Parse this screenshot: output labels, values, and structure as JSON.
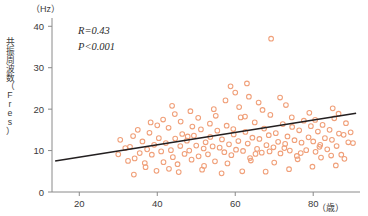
{
  "chart_data": {
    "type": "scatter",
    "title": "",
    "xlabel": "（歳）",
    "ylabel": "共振周波数（Fres）",
    "yunit": "（Hz）",
    "xlim": [
      13,
      92
    ],
    "ylim": [
      0,
      42
    ],
    "xticks": [
      20,
      40,
      60,
      80
    ],
    "xtick_labels": [
      "20",
      "40",
      "60",
      "80"
    ],
    "yticks": [
      0,
      10,
      20,
      30,
      40
    ],
    "ytick_labels": [
      "0",
      "10",
      "20",
      "30",
      "40"
    ],
    "grid": false,
    "legend": "none",
    "marker_style": "open-circle",
    "marker_color": "#f0a07a",
    "annotations": [
      {
        "name": "correlation",
        "text": "R=0.43"
      },
      {
        "name": "p-value",
        "text": "P<0.001"
      }
    ],
    "regression": {
      "name": "linear-fit",
      "color": "#231f20",
      "x_start": 13.8,
      "y_start": 7.5,
      "x_end": 91.0,
      "y_end": 19.0
    },
    "points": [
      [
        30.5,
        12.6
      ],
      [
        31.8,
        10.6
      ],
      [
        33.0,
        10.9
      ],
      [
        34.2,
        8.1
      ],
      [
        34.0,
        4.2
      ],
      [
        35.5,
        9.4
      ],
      [
        36.2,
        12.2
      ],
      [
        37.0,
        6.0
      ],
      [
        37.4,
        10.3
      ],
      [
        38.0,
        14.3
      ],
      [
        38.6,
        9.0
      ],
      [
        39.2,
        11.4
      ],
      [
        39.8,
        5.1
      ],
      [
        40.4,
        13.0
      ],
      [
        41.0,
        9.8
      ],
      [
        41.6,
        7.2
      ],
      [
        42.2,
        11.8
      ],
      [
        42.9,
        15.5
      ],
      [
        43.5,
        10.1
      ],
      [
        44.0,
        8.4
      ],
      [
        44.6,
        12.9
      ],
      [
        45.2,
        6.7
      ],
      [
        45.9,
        11.1
      ],
      [
        46.4,
        14.0
      ],
      [
        47.0,
        9.2
      ],
      [
        47.6,
        12.4
      ],
      [
        48.2,
        10.0
      ],
      [
        48.8,
        7.8
      ],
      [
        49.4,
        13.6
      ],
      [
        50.0,
        11.2
      ],
      [
        50.6,
        8.6
      ],
      [
        51.2,
        15.1
      ],
      [
        51.9,
        10.5
      ],
      [
        52.4,
        12.0
      ],
      [
        53.0,
        9.1
      ],
      [
        53.6,
        13.3
      ],
      [
        54.2,
        11.0
      ],
      [
        54.8,
        7.4
      ],
      [
        55.4,
        14.8
      ],
      [
        56.0,
        10.7
      ],
      [
        56.6,
        12.7
      ],
      [
        57.2,
        9.6
      ],
      [
        57.8,
        16.0
      ],
      [
        58.4,
        11.5
      ],
      [
        59.0,
        8.9
      ],
      [
        59.6,
        13.9
      ],
      [
        60.2,
        10.2
      ],
      [
        60.8,
        12.3
      ],
      [
        61.4,
        18.0
      ],
      [
        62.0,
        9.9
      ],
      [
        62.6,
        14.5
      ],
      [
        63.2,
        11.7
      ],
      [
        63.8,
        8.2
      ],
      [
        64.4,
        13.1
      ],
      [
        65.0,
        16.8
      ],
      [
        65.6,
        10.4
      ],
      [
        66.2,
        12.8
      ],
      [
        66.8,
        9.5
      ],
      [
        67.4,
        15.3
      ],
      [
        68.0,
        11.3
      ],
      [
        68.6,
        13.7
      ],
      [
        69.2,
        37.0
      ],
      [
        69.8,
        10.8
      ],
      [
        70.4,
        14.2
      ],
      [
        71.0,
        12.1
      ],
      [
        71.6,
        9.3
      ],
      [
        72.2,
        16.4
      ],
      [
        72.8,
        11.6
      ],
      [
        73.4,
        13.4
      ],
      [
        74.0,
        10.0
      ],
      [
        74.6,
        15.7
      ],
      [
        75.2,
        12.5
      ],
      [
        75.8,
        8.7
      ],
      [
        76.4,
        14.9
      ],
      [
        77.0,
        11.9
      ],
      [
        77.6,
        17.2
      ],
      [
        78.2,
        10.1
      ],
      [
        78.8,
        13.2
      ],
      [
        79.4,
        15.9
      ],
      [
        80.0,
        12.2
      ],
      [
        80.6,
        9.7
      ],
      [
        81.2,
        14.6
      ],
      [
        81.8,
        11.4
      ],
      [
        82.4,
        16.2
      ],
      [
        83.0,
        13.0
      ],
      [
        83.6,
        10.3
      ],
      [
        84.2,
        15.0
      ],
      [
        84.8,
        12.6
      ],
      [
        85.4,
        17.8
      ],
      [
        86.0,
        11.1
      ],
      [
        86.6,
        14.1
      ],
      [
        87.2,
        9.0
      ],
      [
        87.8,
        13.8
      ],
      [
        88.4,
        16.6
      ],
      [
        89.0,
        12.0
      ],
      [
        33.8,
        13.5
      ],
      [
        36.8,
        7.0
      ],
      [
        40.0,
        16.1
      ],
      [
        43.0,
        5.6
      ],
      [
        46.0,
        17.0
      ],
      [
        49.0,
        15.8
      ],
      [
        52.0,
        6.3
      ],
      [
        55.0,
        18.4
      ],
      [
        58.0,
        6.9
      ],
      [
        61.0,
        20.5
      ],
      [
        64.0,
        7.6
      ],
      [
        67.0,
        19.8
      ],
      [
        70.0,
        7.1
      ],
      [
        73.0,
        21.0
      ],
      [
        76.0,
        7.9
      ],
      [
        79.0,
        19.1
      ],
      [
        82.0,
        8.3
      ],
      [
        85.0,
        20.2
      ],
      [
        88.0,
        8.0
      ],
      [
        60.0,
        24.0
      ],
      [
        57.5,
        22.1
      ],
      [
        63.5,
        23.0
      ],
      [
        66.0,
        21.6
      ],
      [
        71.5,
        22.8
      ],
      [
        54.5,
        20.0
      ],
      [
        44.5,
        18.8
      ],
      [
        48.5,
        19.5
      ],
      [
        41.5,
        17.5
      ],
      [
        50.5,
        17.9
      ],
      [
        53.5,
        16.5
      ],
      [
        59.5,
        15.2
      ],
      [
        62.5,
        18.2
      ],
      [
        69.0,
        18.6
      ],
      [
        74.5,
        18.0
      ],
      [
        80.5,
        17.4
      ],
      [
        86.5,
        18.9
      ],
      [
        35.0,
        15.0
      ],
      [
        38.3,
        16.8
      ],
      [
        32.5,
        7.5
      ],
      [
        30.0,
        9.1
      ],
      [
        45.5,
        4.8
      ],
      [
        51.5,
        5.4
      ],
      [
        56.5,
        4.5
      ],
      [
        61.8,
        5.0
      ],
      [
        67.8,
        4.9
      ],
      [
        73.8,
        5.5
      ],
      [
        79.8,
        6.1
      ],
      [
        85.8,
        6.4
      ],
      [
        43.8,
        20.8
      ],
      [
        47.8,
        13.4
      ],
      [
        65.2,
        9.2
      ],
      [
        68.8,
        9.8
      ],
      [
        72.6,
        10.6
      ],
      [
        76.8,
        9.4
      ],
      [
        81.6,
        10.9
      ],
      [
        84.6,
        8.8
      ],
      [
        89.6,
        14.4
      ],
      [
        90.2,
        11.8
      ],
      [
        58.8,
        25.5
      ],
      [
        63.0,
        26.2
      ]
    ]
  }
}
